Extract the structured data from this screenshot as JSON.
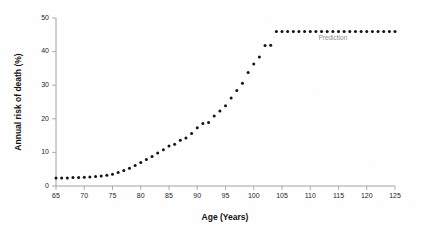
{
  "chart_data": {
    "type": "scatter",
    "title": "",
    "xlabel": "Age (Years)",
    "ylabel": "Annual risk of death (%)",
    "xlim": [
      65,
      125
    ],
    "ylim": [
      0,
      50
    ],
    "xticks": [
      65,
      70,
      75,
      80,
      85,
      90,
      95,
      100,
      105,
      110,
      115,
      120,
      125
    ],
    "yticks": [
      0,
      10,
      20,
      30,
      40,
      50
    ],
    "xtick_labels": [
      "65",
      "70",
      "75",
      "80",
      "85",
      "90",
      "95",
      "100",
      "105",
      "110",
      "115",
      "120",
      "125"
    ],
    "ytick_labels": [
      "0",
      "10",
      "20",
      "30",
      "40",
      "50"
    ],
    "grid": false,
    "legend": "none",
    "marker": "filled-circle",
    "marker_color": "#141414",
    "marker_size": 3,
    "annotations": [
      {
        "text": "Prediction",
        "x": 114,
        "y": 43.5,
        "color": "#8e8e8e"
      }
    ],
    "series": [
      {
        "name": "Observed annual risk of death",
        "color": "#141414",
        "x": [
          65,
          66,
          67,
          68,
          69,
          70,
          71,
          72,
          73,
          74,
          75,
          76,
          77,
          78,
          79,
          80,
          81,
          82,
          83,
          84,
          85,
          86,
          87,
          88,
          89,
          90,
          91,
          92,
          93,
          94,
          95,
          96,
          97,
          98,
          99,
          100,
          101,
          102,
          103
        ],
        "y": [
          2.4,
          2.4,
          2.4,
          2.5,
          2.5,
          2.6,
          2.7,
          2.8,
          3.0,
          3.2,
          3.5,
          4.0,
          4.6,
          5.3,
          6.1,
          7.0,
          7.9,
          8.8,
          9.8,
          10.8,
          11.9,
          12.4,
          13.6,
          14.3,
          15.6,
          17.3,
          18.6,
          18.9,
          20.8,
          22.3,
          23.9,
          26.2,
          28.4,
          30.6,
          33.8,
          36.3,
          38.4,
          41.8,
          41.9
        ]
      },
      {
        "name": "Prediction",
        "color": "#141414",
        "x": [
          104,
          105,
          106,
          107,
          108,
          109,
          110,
          111,
          112,
          113,
          114,
          115,
          116,
          117,
          118,
          119,
          120,
          121,
          122,
          123,
          124,
          125
        ],
        "y": [
          46.0,
          46.0,
          46.0,
          46.0,
          46.0,
          46.0,
          46.0,
          46.0,
          46.0,
          46.0,
          46.0,
          46.0,
          46.0,
          46.0,
          46.0,
          46.0,
          46.0,
          46.0,
          46.0,
          46.0,
          46.0,
          46.0
        ]
      }
    ]
  }
}
